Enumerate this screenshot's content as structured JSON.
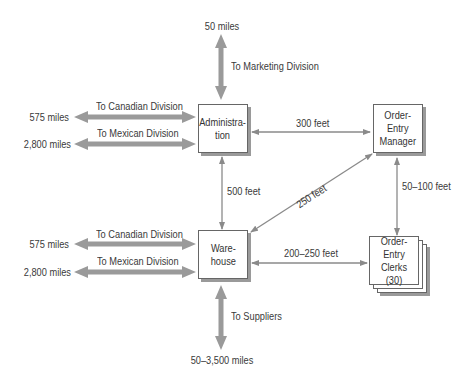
{
  "diagram": {
    "type": "facility distance diagram",
    "nodes": {
      "administration": {
        "line1": "Administra-",
        "line2": "tion"
      },
      "manager": {
        "line1": "Order-",
        "line2": "Entry",
        "line3": "Manager"
      },
      "warehouse": {
        "line1": "Ware-",
        "line2": "house"
      },
      "clerks": {
        "line1": "Order-Entry",
        "line2": "Clerks",
        "line3": "(30)"
      }
    },
    "labels": {
      "marketing_distance": "50 miles",
      "marketing_dest": "To Marketing Division",
      "admin_canadian_dest": "To Canadian Division",
      "admin_canadian_distance": "575 miles",
      "admin_mexican_dest": "To Mexican Division",
      "admin_mexican_distance": "2,800 miles",
      "admin_manager": "300 feet",
      "admin_warehouse": "500 feet",
      "manager_warehouse": "250 feet",
      "manager_clerks": "50–100 feet",
      "wh_canadian_dest": "To Canadian Division",
      "wh_canadian_distance": "575 miles",
      "wh_mexican_dest": "To Mexican Division",
      "wh_mexican_distance": "2,800 miles",
      "warehouse_clerks": "200–250 feet",
      "suppliers_dest": "To Suppliers",
      "suppliers_distance": "50–3,500 miles"
    },
    "colors": {
      "arrow": "#999999",
      "thin_arrow": "#8a8a8a",
      "box_border": "#666666",
      "shadow": "#9a9a9a"
    }
  }
}
